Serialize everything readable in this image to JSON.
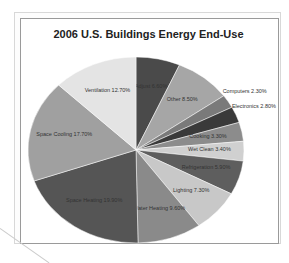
{
  "chart_data": {
    "type": "pie",
    "title": "2006 U.S. Buildings Energy End-Use",
    "slices": [
      {
        "label": "Adjust",
        "value": 6.6,
        "display": "Adjust 6.60%",
        "color": "#4a4a4a"
      },
      {
        "label": "Other",
        "value": 8.5,
        "display": "Other 8.50%",
        "color": "#a6a6a6"
      },
      {
        "label": "Computers",
        "value": 2.3,
        "display": "Computers 2.30%",
        "color": "#7a7a7a"
      },
      {
        "label": "Electronics",
        "value": 2.8,
        "display": "Electronics 2.80%",
        "color": "#3a3a3a"
      },
      {
        "label": "Cooking",
        "value": 3.3,
        "display": "Cooking 3.30%",
        "color": "#8c8c8c"
      },
      {
        "label": "Wet Clean",
        "value": 3.4,
        "display": "Wet Clean 3.40%",
        "color": "#d0d0d0"
      },
      {
        "label": "Refrigeration",
        "value": 5.9,
        "display": "Refrigeration 5.90%",
        "color": "#5e5e5e"
      },
      {
        "label": "Lighting",
        "value": 7.3,
        "display": "Lighting 7.30%",
        "color": "#c8c8c8"
      },
      {
        "label": "Water Heating",
        "value": 9.6,
        "display": "Water Heating 9.60%",
        "color": "#8a8a8a"
      },
      {
        "label": "Space Heating",
        "value": 19.9,
        "display": "Space Heating 19.90%",
        "color": "#555555"
      },
      {
        "label": "Space Cooling",
        "value": 17.7,
        "display": "Space Cooling 17.70%",
        "color": "#a0a0a0"
      },
      {
        "label": "Ventilation",
        "value": 12.7,
        "display": "Ventilation 12.70%",
        "color": "#e4e4e4"
      }
    ],
    "legend": "none (data labels on slices)"
  },
  "chart": {
    "title": "2006 U.S. Buildings Energy End-Use"
  }
}
